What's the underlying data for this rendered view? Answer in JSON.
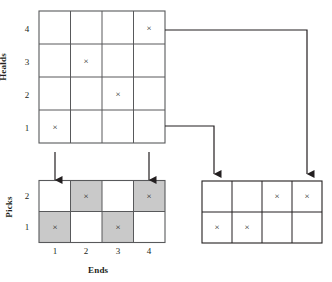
{
  "figure": {
    "type": "weaving-draft-diagram",
    "axes": {
      "healds_label": "Healds",
      "picks_label": "Picks",
      "ends_label": "Ends"
    },
    "colors": {
      "line": "#58595b",
      "grid": "#58595b",
      "shaded_cell": "#c9c9c9",
      "mark": "#231f20",
      "background": "#ffffff"
    },
    "mark_glyph": "x"
  },
  "threading_grid": {
    "name": "threading-draft",
    "columns": 4,
    "rows": 4,
    "row_labels": [
      "1",
      "2",
      "3",
      "4"
    ],
    "marks": [
      {
        "end": 1,
        "heald": 1
      },
      {
        "end": 2,
        "heald": 3
      },
      {
        "end": 3,
        "heald": 2
      },
      {
        "end": 4,
        "heald": 4
      }
    ]
  },
  "peg_plan_grid": {
    "name": "peg-plan",
    "columns": 4,
    "rows": 2,
    "row_labels": [
      "1",
      "2"
    ],
    "column_labels": [
      "1",
      "2",
      "3",
      "4"
    ],
    "cells": [
      {
        "end": 1,
        "pick": 2,
        "shaded": false,
        "mark": false
      },
      {
        "end": 2,
        "pick": 2,
        "shaded": true,
        "mark": true
      },
      {
        "end": 3,
        "pick": 2,
        "shaded": false,
        "mark": false
      },
      {
        "end": 4,
        "pick": 2,
        "shaded": true,
        "mark": true
      },
      {
        "end": 1,
        "pick": 1,
        "shaded": true,
        "mark": true
      },
      {
        "end": 2,
        "pick": 1,
        "shaded": false,
        "mark": false
      },
      {
        "end": 3,
        "pick": 1,
        "shaded": true,
        "mark": true
      },
      {
        "end": 4,
        "pick": 1,
        "shaded": false,
        "mark": false
      }
    ]
  },
  "lifting_plan_grid": {
    "name": "lifting-plan",
    "columns": 4,
    "rows": 2,
    "marks": [
      {
        "column": 3,
        "row": 2
      },
      {
        "column": 4,
        "row": 2
      },
      {
        "column": 1,
        "row": 1
      },
      {
        "column": 2,
        "row": 1
      }
    ]
  },
  "connectors": [
    {
      "name": "peg-to-threading-end-1",
      "direction": "up"
    },
    {
      "name": "peg-to-threading-end-4",
      "direction": "up"
    },
    {
      "name": "heald-1-to-lifting-col-1",
      "direction": "down"
    },
    {
      "name": "heald-4-to-lifting-col-4",
      "direction": "down"
    }
  ],
  "labels": {
    "healds_ticks": [
      "4",
      "3",
      "2",
      "1"
    ],
    "picks_ticks": [
      "2",
      "1"
    ],
    "ends_ticks": [
      "1",
      "2",
      "3",
      "4"
    ]
  }
}
